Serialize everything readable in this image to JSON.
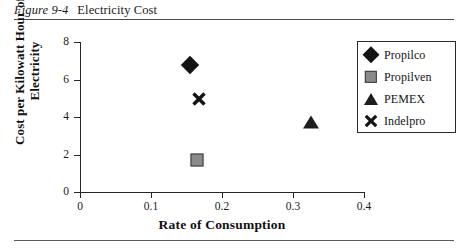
{
  "caption": {
    "figure_number": "Figure 9-4",
    "title": "Electricity Cost"
  },
  "chart_data": {
    "type": "scatter",
    "title": "Electricity Cost",
    "xlabel": "Rate of Consumption",
    "ylabel": "Cost per Kilowatt Hour of Electricity",
    "ylabel_lines": [
      "Cost per Kilowatt Hour of",
      "Electricity"
    ],
    "xlim": [
      0,
      0.4
    ],
    "ylim": [
      0,
      8
    ],
    "xticks": [
      0,
      0.1,
      0.2,
      0.3,
      0.4
    ],
    "xtick_labels": [
      "0",
      "0.1",
      "0.2",
      "0.3",
      "0.4"
    ],
    "yticks": [
      0,
      2,
      4,
      6,
      8
    ],
    "ytick_labels": [
      "0",
      "2",
      "4",
      "6",
      "8"
    ],
    "grid": false,
    "legend_position": "top-right",
    "series": [
      {
        "name": "Propilco",
        "marker": "diamond",
        "color": "#141414",
        "x": 0.155,
        "y": 6.8
      },
      {
        "name": "Propilven",
        "marker": "square",
        "color": "#8a8a8a",
        "x": 0.165,
        "y": 1.7
      },
      {
        "name": "PEMEX",
        "marker": "triangle",
        "color": "#1e1e1e",
        "x": 0.325,
        "y": 3.75
      },
      {
        "name": "Indelpro",
        "marker": "cross",
        "color": "#141414",
        "x": 0.167,
        "y": 4.95
      }
    ]
  },
  "legend": {
    "items": [
      {
        "label": "Propilco"
      },
      {
        "label": "Propilven"
      },
      {
        "label": "PEMEX"
      },
      {
        "label": "Indelpro"
      }
    ]
  }
}
